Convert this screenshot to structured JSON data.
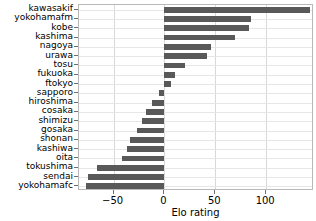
{
  "chart_data": {
    "type": "bar",
    "orientation": "horizontal",
    "title": "",
    "xlabel": "Elo rating",
    "ylabel": "",
    "xlim": [
      -84,
      147
    ],
    "xticks": [
      -50,
      0,
      50,
      100
    ],
    "xticklabels": [
      "−50",
      "0",
      "50",
      "100"
    ],
    "grid": true,
    "legend": null,
    "bar_color": "#59595a",
    "categories": [
      "kawasakif",
      "yokohamafm",
      "kobe",
      "kashima",
      "nagoya",
      "urawa",
      "tosu",
      "fukuoka",
      "ftokyo",
      "sapporo",
      "hiroshima",
      "cosaka",
      "shimizu",
      "gosaka",
      "shonan",
      "kashiwa",
      "oita",
      "tokushima",
      "sendai",
      "yokohamafc"
    ],
    "values": [
      143,
      85,
      83,
      69,
      46,
      42,
      20,
      10,
      6,
      -5,
      -12,
      -18,
      -22,
      -27,
      -34,
      -37,
      -42,
      -66,
      -75,
      -77
    ]
  }
}
